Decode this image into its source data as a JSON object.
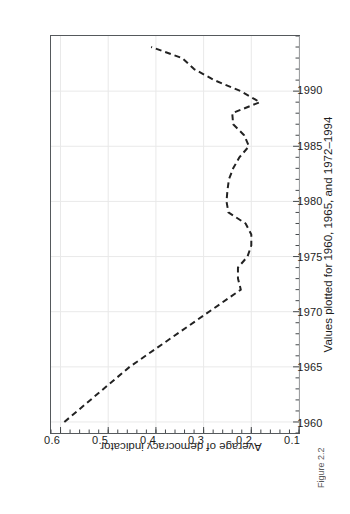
{
  "figure": {
    "caption": "Figure 2.2"
  },
  "chart_data": {
    "type": "line",
    "title": "",
    "subtitle": "",
    "xlabel": "Values plotted for 1960, 1965, and 1972–1994",
    "ylabel": "Average of democracy indicator",
    "xlim": [
      1959,
      1995
    ],
    "ylim": [
      0.1,
      0.62
    ],
    "grid": true,
    "legend": null,
    "orientation": "rotated-90-ccw",
    "line_style": "dashed",
    "line_color": "#222222",
    "xticks": [
      1960,
      1965,
      1970,
      1975,
      1980,
      1985,
      1990
    ],
    "xtick_labels": [
      "1960",
      "1965",
      "1970",
      "1975",
      "1980",
      "1985",
      "1990"
    ],
    "xminor_tick_step": 1,
    "yticks": [
      0.6,
      0.5,
      0.4,
      0.3,
      0.2,
      0.1
    ],
    "ytick_labels": [
      "0.6",
      "0.5",
      "0.4",
      "0.3",
      "0.2",
      "0.1"
    ],
    "series": [
      {
        "name": "Average of democracy indicator",
        "x": [
          1960,
          1965,
          1972,
          1973,
          1974,
          1975,
          1976,
          1977,
          1978,
          1979,
          1980,
          1981,
          1982,
          1983,
          1984,
          1985,
          1986,
          1987,
          1988,
          1989,
          1990,
          1991,
          1992,
          1993,
          1994
        ],
        "values": [
          0.592,
          0.455,
          0.222,
          0.228,
          0.228,
          0.208,
          0.2,
          0.2,
          0.212,
          0.248,
          0.252,
          0.25,
          0.247,
          0.238,
          0.225,
          0.205,
          0.215,
          0.238,
          0.24,
          0.182,
          0.222,
          0.278,
          0.32,
          0.345,
          0.41
        ]
      }
    ]
  }
}
